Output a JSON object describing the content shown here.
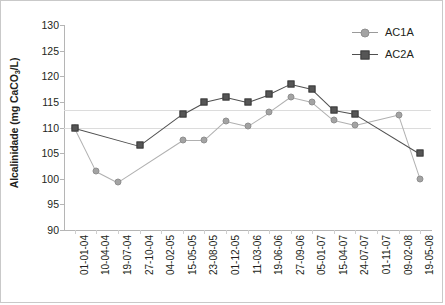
{
  "chart_data": {
    "type": "line",
    "title": "",
    "xlabel": "",
    "ylabel": "Alcalinidade (mg CaCO3/L)",
    "ylabel_prefix": "Alcalinidade (mg CaCO",
    "ylabel_sub": "3",
    "ylabel_suffix": "/L)",
    "ylim": [
      90,
      130
    ],
    "ytick_step": 5,
    "yticks": [
      130,
      125,
      120,
      115,
      110,
      105,
      100,
      95,
      90
    ],
    "grid": false,
    "legend_position": "top-right",
    "reference_lines": [
      113.5,
      110.0
    ],
    "categories": [
      "01-01-04",
      "10-04-04",
      "19-07-04",
      "27-10-04",
      "04-02-05",
      "15-05-05",
      "23-08-05",
      "01-12-05",
      "11-03-06",
      "19-06-06",
      "27-09-06",
      "05-01-07",
      "15-04-07",
      "24-07-07",
      "01-11-07",
      "09-02-08",
      "19-05-08"
    ],
    "series": [
      {
        "name": "AC1A",
        "color": "#a3a3a3",
        "marker": "circle",
        "values": [
          110.0,
          101.5,
          99.3,
          null,
          null,
          107.5,
          107.5,
          111.3,
          110.3,
          113.0,
          116.0,
          115.0,
          111.5,
          110.5,
          null,
          112.5,
          100.0
        ]
      },
      {
        "name": "AC2A",
        "color": "#565656",
        "marker": "square",
        "values": [
          110.0,
          null,
          null,
          106.5,
          null,
          112.7,
          115.0,
          116.0,
          115.0,
          116.5,
          118.5,
          117.5,
          113.5,
          112.7,
          null,
          null,
          105.0
        ]
      }
    ]
  },
  "legend": {
    "items": [
      {
        "label": "AC1A"
      },
      {
        "label": "AC2A"
      }
    ]
  }
}
